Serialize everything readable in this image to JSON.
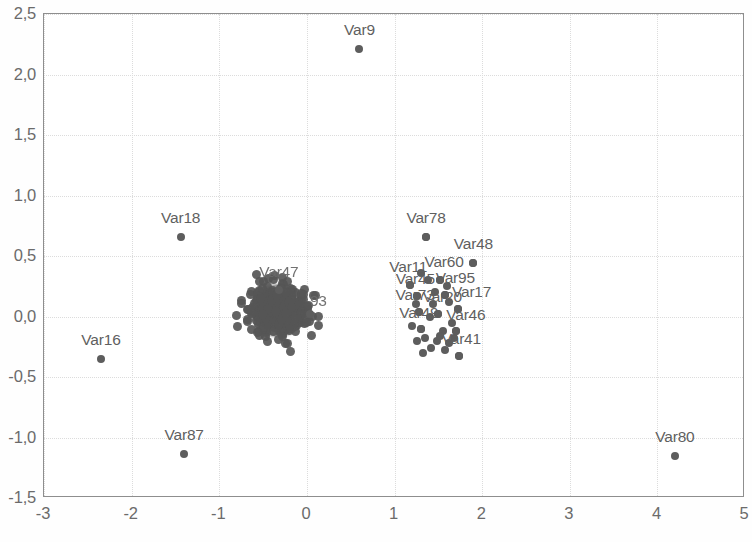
{
  "chart_data": {
    "type": "scatter",
    "title": "",
    "xlabel": "",
    "ylabel": "",
    "xlim": [
      -3,
      5
    ],
    "ylim": [
      -1.5,
      2.5
    ],
    "xticks": [
      -3,
      -2,
      -1,
      0,
      1,
      2,
      3,
      4,
      5
    ],
    "xtick_labels": [
      "-3",
      "-2",
      "-1",
      "0",
      "1",
      "2",
      "3",
      "4",
      "5"
    ],
    "yticks": [
      -1.5,
      -1.0,
      -0.5,
      0.0,
      0.5,
      1.0,
      1.5,
      2.0,
      2.5
    ],
    "ytick_labels": [
      "-1,5",
      "-1,0",
      "-0,5",
      "0,0",
      "0,5",
      "1,0",
      "1,5",
      "2,0",
      "2,5"
    ],
    "grid": true,
    "decimal_separator": ",",
    "legend": null,
    "marker_color": "#5d5d5d",
    "labeled_points": [
      {
        "label": "Var9",
        "x": 0.6,
        "y": 2.21,
        "label_dx": 0,
        "label_dy": -10
      },
      {
        "label": "Var18",
        "x": -1.44,
        "y": 0.66,
        "label_dx": 0,
        "label_dy": -10
      },
      {
        "label": "Var16",
        "x": -2.35,
        "y": -0.35,
        "label_dx": 0,
        "label_dy": -10
      },
      {
        "label": "Var87",
        "x": -1.4,
        "y": -1.14,
        "label_dx": 0,
        "label_dy": -10
      },
      {
        "label": "Var80",
        "x": 4.2,
        "y": -1.15,
        "label_dx": 0,
        "label_dy": -10
      },
      {
        "label": "Var78",
        "x": 1.36,
        "y": 0.66,
        "label_dx": 0,
        "label_dy": -10
      },
      {
        "label": "Var48",
        "x": 1.9,
        "y": 0.44,
        "label_dx": 0,
        "label_dy": -10
      },
      {
        "label": "Var60",
        "x": 1.52,
        "y": 0.3,
        "label_dx": 4,
        "label_dy": -9
      },
      {
        "label": "Var11",
        "x": 1.18,
        "y": 0.26,
        "label_dx": -2,
        "label_dy": -9
      },
      {
        "label": "Var95",
        "x": 1.58,
        "y": 0.18,
        "label_dx": 10,
        "label_dy": -8
      },
      {
        "label": "Var45",
        "x": 1.26,
        "y": 0.17,
        "label_dx": -2,
        "label_dy": -8
      },
      {
        "label": "Var17",
        "x": 1.72,
        "y": 0.06,
        "label_dx": 14,
        "label_dy": -8
      },
      {
        "label": "Var73",
        "x": 1.28,
        "y": 0.04,
        "label_dx": -4,
        "label_dy": -8
      },
      {
        "label": "Var20",
        "x": 1.5,
        "y": 0.02,
        "label_dx": 4,
        "label_dy": -8
      },
      {
        "label": "Var46",
        "x": 1.7,
        "y": -0.12,
        "label_dx": 10,
        "label_dy": -7
      },
      {
        "label": "Var49",
        "x": 1.3,
        "y": -0.1,
        "label_dx": -2,
        "label_dy": -7
      },
      {
        "label": "Var41",
        "x": 1.74,
        "y": -0.33,
        "label_dx": 2,
        "label_dy": -8
      },
      {
        "label": "Var47",
        "x": -0.32,
        "y": 0.22,
        "label_dx": 0,
        "label_dy": -9
      },
      {
        "label": "93",
        "x": 0.04,
        "y": 0.02,
        "label_dx": 8,
        "label_dy": -4
      }
    ],
    "right_cluster_points": [
      [
        1.18,
        0.26
      ],
      [
        1.52,
        0.3
      ],
      [
        1.9,
        0.44
      ],
      [
        1.36,
        0.66
      ],
      [
        1.26,
        0.17
      ],
      [
        1.58,
        0.18
      ],
      [
        1.46,
        0.2
      ],
      [
        1.62,
        0.12
      ],
      [
        1.28,
        0.04
      ],
      [
        1.5,
        0.02
      ],
      [
        1.72,
        0.06
      ],
      [
        1.4,
        0.0
      ],
      [
        1.3,
        -0.1
      ],
      [
        1.55,
        -0.12
      ],
      [
        1.7,
        -0.12
      ],
      [
        1.2,
        -0.08
      ],
      [
        1.35,
        -0.18
      ],
      [
        1.48,
        -0.2
      ],
      [
        1.62,
        -0.22
      ],
      [
        1.26,
        -0.2
      ],
      [
        1.42,
        -0.26
      ],
      [
        1.58,
        -0.28
      ],
      [
        1.74,
        -0.33
      ],
      [
        1.33,
        -0.3
      ],
      [
        1.52,
        -0.16
      ],
      [
        1.66,
        -0.05
      ],
      [
        1.24,
        0.1
      ],
      [
        1.44,
        0.1
      ],
      [
        1.6,
        0.25
      ],
      [
        1.38,
        0.3
      ],
      [
        1.3,
        0.36
      ],
      [
        1.68,
        -0.18
      ]
    ],
    "central_cluster": {
      "center_x": -0.33,
      "center_y": 0.05,
      "spread_x": 0.3,
      "spread_y": 0.17,
      "n_points": 420,
      "description": "dense overlapping blob of unlabeled points"
    }
  },
  "axes": {
    "y_tick_labels": [
      "2,5",
      "2,0",
      "1,5",
      "1,0",
      "0,5",
      "0,0",
      "-0,5",
      "-1,0",
      "-1,5"
    ],
    "x_tick_labels": [
      "-3",
      "-2",
      "-1",
      "0",
      "1",
      "2",
      "3",
      "4",
      "5"
    ]
  }
}
